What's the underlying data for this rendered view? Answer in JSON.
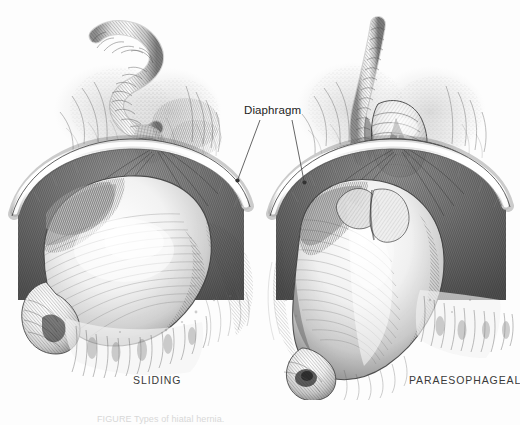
{
  "figure": {
    "background_color": "#fdfdfd",
    "ink_color": "#2b2b2b",
    "width": 520,
    "height": 425
  },
  "annotations": {
    "diaphragm_label": "Diaphragm",
    "leader_dot_color": "#333333"
  },
  "panels": [
    {
      "id": "sliding",
      "label": "SLIDING",
      "structures": [
        "esophagus",
        "gastroesophageal junction",
        "diaphragm",
        "stomach",
        "greater omentum"
      ]
    },
    {
      "id": "paraesophageal",
      "label": "PARAESOPHAGEAL",
      "structures": [
        "esophagus",
        "herniated gastric fundus",
        "diaphragm",
        "stomach",
        "greater omentum"
      ]
    }
  ],
  "caption": {
    "prefix": "FIGURE",
    "text": "FIGURE  Types of hiatal hernia."
  }
}
